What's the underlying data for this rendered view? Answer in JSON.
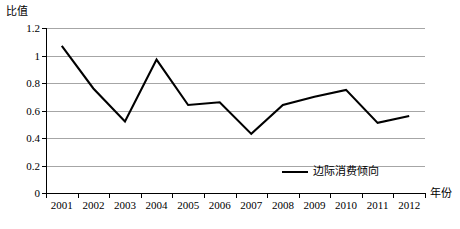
{
  "chart_data": {
    "type": "line",
    "title": "",
    "xlabel": "年份",
    "ylabel": "比值",
    "categories": [
      "2001",
      "2002",
      "2003",
      "2004",
      "2005",
      "2006",
      "2007",
      "2008",
      "2009",
      "2010",
      "2011",
      "2012"
    ],
    "series": [
      {
        "name": "边际消费倾向",
        "color": "#000000",
        "values": [
          1.07,
          0.76,
          0.52,
          0.97,
          0.64,
          0.66,
          0.43,
          0.64,
          0.7,
          0.75,
          0.51,
          0.56
        ]
      }
    ],
    "ylim": [
      0,
      1.2
    ],
    "yticks": [
      "0",
      "0.2",
      "0.4",
      "0.6",
      "0.8",
      "1",
      "1.2"
    ],
    "ytick_values": [
      0,
      0.2,
      0.4,
      0.6,
      0.8,
      1.0,
      1.2
    ],
    "grid": true,
    "grid_color": "#a6a6a6",
    "legend_position": "bottom-right-inside"
  },
  "legend": {
    "entries": [
      {
        "label": "边际消费倾向"
      }
    ]
  },
  "axes": {
    "y_title": "比值",
    "x_title": "年份"
  }
}
